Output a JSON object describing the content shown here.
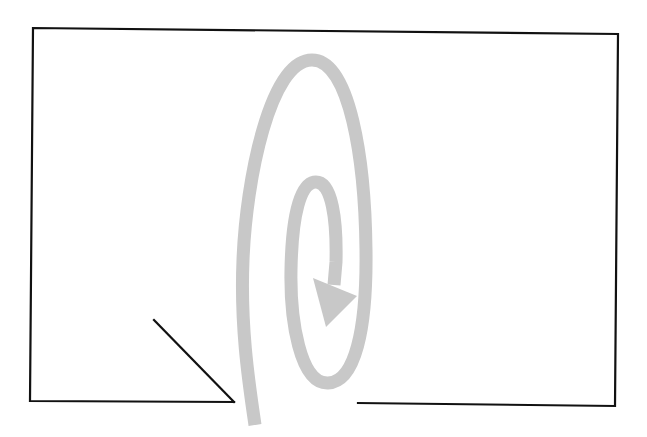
{
  "diagram": {
    "title": "",
    "colors": {
      "background": "#ffffff",
      "outline": "#111111",
      "spiral": "#c8c8c8"
    },
    "frame": {
      "description": "Rectangular outline open at the bottom with a gap; a diagonal line slants into the gap from the left",
      "top_left": [
        33,
        28
      ],
      "top_right": [
        618,
        34
      ],
      "bottom_right": [
        615,
        406
      ],
      "bottom_left": [
        30,
        401
      ],
      "bottom_left_segment_end": [
        234,
        402
      ],
      "bottom_right_segment_start": [
        358,
        403
      ],
      "diagonal_start": [
        154,
        320
      ],
      "diagonal_end": [
        234,
        402
      ]
    },
    "spiral": {
      "description": "Grey inward spiral entering through the gap in the bottom edge, ending in an arrowhead",
      "stroke_width": 13,
      "arrowhead": "triangle"
    }
  }
}
